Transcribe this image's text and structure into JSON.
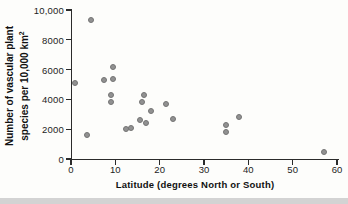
{
  "chart_data": {
    "type": "scatter",
    "title": "",
    "xlabel": "Latitude (degrees North or South)",
    "ylabel_line1": "Number of vascular plant",
    "ylabel_line2": "species per 10,000 km",
    "ylabel_superscript": "2",
    "xlim": [
      0,
      60
    ],
    "ylim": [
      0,
      10000
    ],
    "grid": false,
    "legend": "none",
    "point_color": "#919191",
    "x_ticks": [
      0,
      10,
      20,
      30,
      40,
      50,
      60
    ],
    "y_tick_values": [
      0,
      2000,
      4000,
      6000,
      8000,
      10000
    ],
    "y_tick_labels": [
      "0",
      "2000",
      "4000",
      "6000",
      "8000",
      "10,000"
    ],
    "points": [
      {
        "x": 1,
        "y": 5100
      },
      {
        "x": 3.5,
        "y": 1600
      },
      {
        "x": 4.5,
        "y": 9300
      },
      {
        "x": 7.5,
        "y": 5300
      },
      {
        "x": 9,
        "y": 4300
      },
      {
        "x": 9,
        "y": 3800
      },
      {
        "x": 9.5,
        "y": 6200
      },
      {
        "x": 9.5,
        "y": 5400
      },
      {
        "x": 12.5,
        "y": 2000
      },
      {
        "x": 13.5,
        "y": 2100
      },
      {
        "x": 15.5,
        "y": 2600
      },
      {
        "x": 16,
        "y": 3800
      },
      {
        "x": 16.5,
        "y": 4300
      },
      {
        "x": 17,
        "y": 2400
      },
      {
        "x": 18,
        "y": 3200
      },
      {
        "x": 21.5,
        "y": 3700
      },
      {
        "x": 23,
        "y": 2700
      },
      {
        "x": 35,
        "y": 2300
      },
      {
        "x": 35,
        "y": 1800
      },
      {
        "x": 38,
        "y": 2800
      },
      {
        "x": 57,
        "y": 500
      }
    ]
  }
}
